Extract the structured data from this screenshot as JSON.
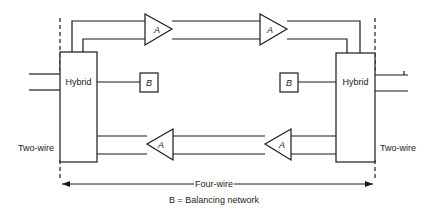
{
  "diagram": {
    "hybrid_left": {
      "label": "Hybrid"
    },
    "hybrid_right": {
      "label": "Hybrid"
    },
    "amplifiers": [
      {
        "id": "top-left",
        "label": "A",
        "direction": "right"
      },
      {
        "id": "top-right",
        "label": "A",
        "direction": "right"
      },
      {
        "id": "bottom-left",
        "label": "A",
        "direction": "left"
      },
      {
        "id": "bottom-right",
        "label": "A",
        "direction": "left"
      }
    ],
    "balancing_left": {
      "label": "B"
    },
    "balancing_right": {
      "label": "B"
    },
    "two_wire_left": "Two-wire",
    "two_wire_right": "Two-wire",
    "four_wire": "Four-wire",
    "legend": "B = Balancing network"
  },
  "colors": {
    "line": "#1a1a1a",
    "background": "#ffffff"
  }
}
